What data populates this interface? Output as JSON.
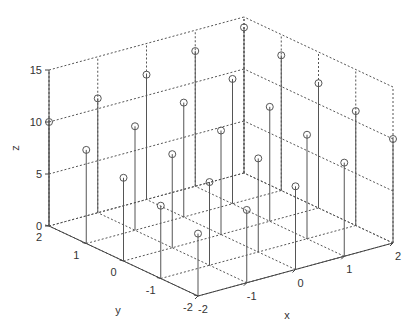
{
  "chart_data": {
    "type": "stem3",
    "title": "",
    "xlabel": "x",
    "ylabel": "y",
    "zlabel": "z",
    "x": [
      -2,
      -1,
      0,
      1,
      2
    ],
    "y": [
      -2,
      -1,
      0,
      1,
      2
    ],
    "z_formula": "z = 10 + x + y",
    "points": [
      {
        "x": -2,
        "y": -2,
        "z": 6
      },
      {
        "x": -1,
        "y": -2,
        "z": 7
      },
      {
        "x": 0,
        "y": -2,
        "z": 8
      },
      {
        "x": 1,
        "y": -2,
        "z": 9
      },
      {
        "x": 2,
        "y": -2,
        "z": 10
      },
      {
        "x": -2,
        "y": -1,
        "z": 7
      },
      {
        "x": -1,
        "y": -1,
        "z": 8
      },
      {
        "x": 0,
        "y": -1,
        "z": 9
      },
      {
        "x": 1,
        "y": -1,
        "z": 10
      },
      {
        "x": 2,
        "y": -1,
        "z": 11
      },
      {
        "x": -2,
        "y": 0,
        "z": 8
      },
      {
        "x": -1,
        "y": 0,
        "z": 9
      },
      {
        "x": 0,
        "y": 0,
        "z": 10
      },
      {
        "x": 1,
        "y": 0,
        "z": 11
      },
      {
        "x": 2,
        "y": 0,
        "z": 12
      },
      {
        "x": -2,
        "y": 1,
        "z": 9
      },
      {
        "x": -1,
        "y": 1,
        "z": 10
      },
      {
        "x": 0,
        "y": 1,
        "z": 11
      },
      {
        "x": 1,
        "y": 1,
        "z": 12
      },
      {
        "x": 2,
        "y": 1,
        "z": 13
      },
      {
        "x": -2,
        "y": 2,
        "z": 10
      },
      {
        "x": -1,
        "y": 2,
        "z": 11
      },
      {
        "x": 0,
        "y": 2,
        "z": 12
      },
      {
        "x": 1,
        "y": 2,
        "z": 13
      },
      {
        "x": 2,
        "y": 2,
        "z": 14
      }
    ],
    "xticks": [
      "-2",
      "-1",
      "0",
      "1",
      "2"
    ],
    "yticks": [
      "-2",
      "-1",
      "0",
      "1",
      "2"
    ],
    "zticks": [
      "0",
      "5",
      "10",
      "15"
    ],
    "xlim": [
      -2,
      2
    ],
    "ylim": [
      -2,
      2
    ],
    "zlim": [
      0,
      15
    ],
    "grid": true,
    "legend": null,
    "marker": "circle",
    "colors": {
      "stem": "#555555",
      "grid": "#555555",
      "axis": "#444444",
      "text": "#333333"
    }
  }
}
